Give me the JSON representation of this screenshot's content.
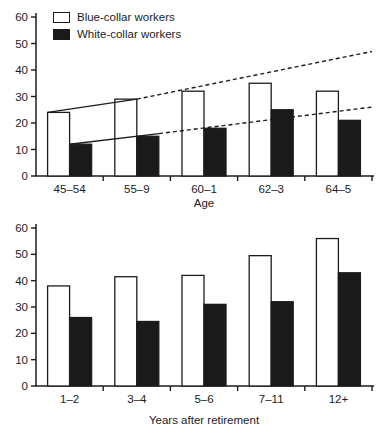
{
  "figure_bg": "#ffffff",
  "ink_color": "#1c1c1c",
  "bar_colors": {
    "blue_collar": "#ffffff",
    "white_collar": "#1a1a1a"
  },
  "legend": {
    "items": [
      {
        "label": "Blue-collar workers",
        "swatch": "white"
      },
      {
        "label": "White-collar workers",
        "swatch": "black"
      }
    ]
  },
  "chart_data": [
    {
      "type": "bar",
      "title": "",
      "categories": [
        "45–54",
        "55–9",
        "60–1",
        "62–3",
        "64–5"
      ],
      "series": [
        {
          "name": "Blue-collar workers",
          "fill": "white",
          "values": [
            24,
            29,
            32,
            35,
            32
          ]
        },
        {
          "name": "White-collar workers",
          "fill": "black",
          "values": [
            12,
            15,
            18,
            25,
            21
          ]
        }
      ],
      "xlabel": "Age",
      "ylabel": "",
      "ylim": [
        0,
        60
      ],
      "yticks": [
        0,
        10,
        20,
        30,
        40,
        50,
        60
      ],
      "grid": false,
      "legend_position": "top-left",
      "trend_lines": [
        {
          "name": "blue-collar-trend",
          "points": [
            [
              0.035,
              24
            ],
            [
              0.3,
              29
            ],
            [
              1.0,
              47
            ]
          ],
          "segment_styles": [
            "solid",
            "dashed"
          ]
        },
        {
          "name": "white-collar-trend",
          "points": [
            [
              0.1,
              12
            ],
            [
              0.366,
              16
            ],
            [
              1.0,
              26
            ]
          ],
          "segment_styles": [
            "solid",
            "dashed"
          ]
        }
      ]
    },
    {
      "type": "bar",
      "title": "",
      "categories": [
        "1–2",
        "3–4",
        "5–6",
        "7–11",
        "12+"
      ],
      "series": [
        {
          "name": "Blue-collar workers",
          "fill": "white",
          "values": [
            38,
            41.5,
            42,
            49.5,
            56
          ]
        },
        {
          "name": "White-collar workers",
          "fill": "black",
          "values": [
            26,
            24.5,
            31,
            32,
            43
          ]
        }
      ],
      "xlabel": "Years after retirement",
      "ylabel": "",
      "ylim": [
        0,
        60
      ],
      "yticks": [
        0,
        10,
        20,
        30,
        40,
        50,
        60
      ],
      "grid": false,
      "legend_position": "none",
      "trend_lines": []
    }
  ]
}
